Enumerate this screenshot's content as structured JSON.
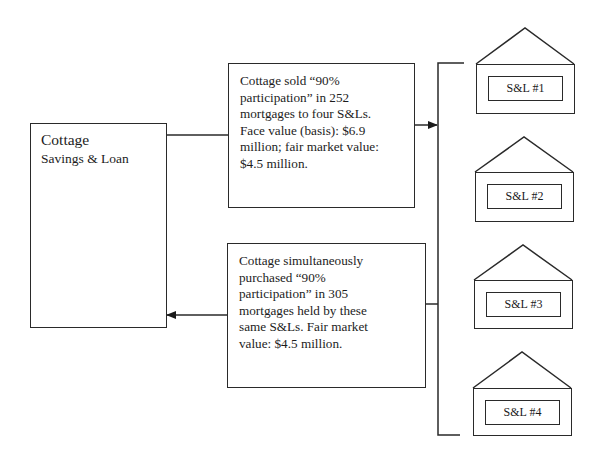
{
  "cottage": {
    "title": "Cottage",
    "subtitle": "Savings & Loan"
  },
  "sale_box": {
    "lines": [
      "Cottage sold “90%",
      "participation” in 252",
      "mortgages to four S&Ls.",
      "Face value (basis): $6.9",
      "million; fair market value:",
      "$4.5 million."
    ]
  },
  "purchase_box": {
    "lines": [
      "Cottage simultaneously",
      "purchased “90%",
      "participation” in 305",
      "mortgages held by these",
      "same S&Ls.  Fair market",
      "value: $4.5 million."
    ]
  },
  "savings_and_loans": [
    {
      "label": "S&L #1"
    },
    {
      "label": "S&L #2"
    },
    {
      "label": "S&L #3"
    },
    {
      "label": "S&L #4"
    }
  ],
  "colors": {
    "line": "#2a2a2a",
    "background": "#ffffff"
  }
}
